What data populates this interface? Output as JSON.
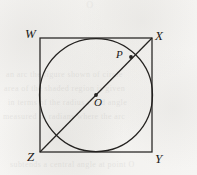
{
  "figure": {
    "caption": "",
    "stroke_color": "#242220",
    "background_color": "#f6f5f3",
    "labels": {
      "W": "W",
      "X": "X",
      "Y": "Y",
      "Z": "Z",
      "P": "P",
      "O": "O"
    }
  },
  "chart_data": {
    "type": "diagram",
    "title": "",
    "xlabel": "",
    "ylabel": "",
    "shapes": [
      {
        "name": "square-WXYZ",
        "kind": "rect",
        "x": 40,
        "y": 38,
        "width": 112,
        "height": 114,
        "vertices": [
          {
            "label": "W",
            "x": 40,
            "y": 38
          },
          {
            "label": "X",
            "x": 152,
            "y": 38
          },
          {
            "label": "Y",
            "x": 152,
            "y": 152
          },
          {
            "label": "Z",
            "x": 40,
            "y": 152
          }
        ]
      },
      {
        "name": "inscribed-circle",
        "kind": "circle",
        "cx": 96,
        "cy": 95,
        "r": 56.5,
        "center_label": "O"
      },
      {
        "name": "diagonal-ZX",
        "kind": "line",
        "x1": 40,
        "y1": 152,
        "x2": 152,
        "y2": 38,
        "endpoints": [
          "Z",
          "X"
        ]
      }
    ],
    "points": [
      {
        "label": "O",
        "x": 96,
        "y": 95,
        "role": "circle-centre",
        "marker": "dot"
      },
      {
        "label": "P",
        "x": 131,
        "y": 57,
        "role": "circle-diagonal-intersection",
        "marker": "dot"
      }
    ]
  },
  "bleed_text": {
    "top_glyph": "o",
    "lines": [
      "an arc  the  figure  shown  of  circle",
      "area of  the  shaded  region  is  given",
      "in  terms  of  the  radius  r  and  angle",
      "measured  in  radians  where  the  arc",
      "subtends  a  central  angle  at  point  O"
    ]
  }
}
